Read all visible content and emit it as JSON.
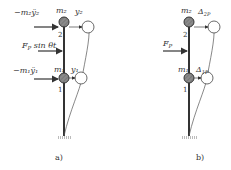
{
  "figure": {
    "panel_a": {
      "caption": "a)",
      "inertia_force_top": "−m₂ÿ₂",
      "excitation": "F_P sin θt",
      "excitation_main": "F",
      "excitation_sub": "P",
      "excitation_rest": " sin θt",
      "inertia_force_bottom": "−m₁ÿ₁",
      "mass_top": "m₂",
      "mass_bottom": "m₁",
      "disp_top": "y₂",
      "disp_bottom": "y₁",
      "node_top": "2",
      "node_bottom": "1"
    },
    "panel_b": {
      "caption": "b)",
      "load_main": "F",
      "load_sub": "P",
      "mass_top": "m₂",
      "mass_bottom": "m₁",
      "disp_top_main": "Δ",
      "disp_top_sub": "2P",
      "disp_bottom_main": "Δ",
      "disp_bottom_sub": "1P",
      "node_top": "2",
      "node_bottom": "1"
    },
    "colors": {
      "line": "#333333",
      "mass_fill": "#8a8a8a"
    }
  }
}
